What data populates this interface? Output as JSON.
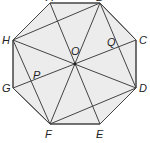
{
  "figure": {
    "type": "regular-octagon",
    "fill_color": "#ececec",
    "line_color": "#444444",
    "vertices": [
      "A",
      "B",
      "C",
      "D",
      "E",
      "F",
      "G",
      "H"
    ],
    "center": "O",
    "points": {
      "A": "A",
      "B": "B",
      "C": "C",
      "D": "D",
      "E": "E",
      "F": "F",
      "G": "G",
      "H": "H",
      "O": "O",
      "P": "P",
      "Q": "Q"
    },
    "segments": [
      [
        "A",
        "B"
      ],
      [
        "B",
        "C"
      ],
      [
        "C",
        "D"
      ],
      [
        "D",
        "E"
      ],
      [
        "E",
        "F"
      ],
      [
        "F",
        "G"
      ],
      [
        "G",
        "H"
      ],
      [
        "H",
        "A"
      ],
      [
        "A",
        "E"
      ],
      [
        "B",
        "F"
      ],
      [
        "C",
        "G"
      ],
      [
        "D",
        "H"
      ],
      [
        "H",
        "B"
      ],
      [
        "B",
        "D"
      ],
      [
        "D",
        "F"
      ],
      [
        "F",
        "H"
      ]
    ],
    "intersections": {
      "P": [
        "C",
        "G",
        "F",
        "H"
      ],
      "Q": [
        "C",
        "G",
        "B",
        "D"
      ]
    }
  }
}
